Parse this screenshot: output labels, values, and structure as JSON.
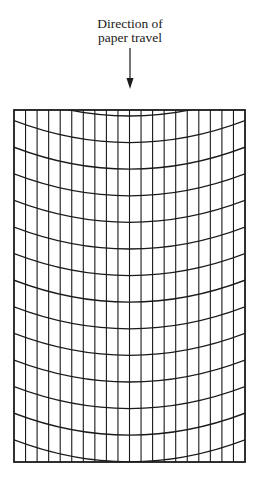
{
  "caption": {
    "line1": "Direction of",
    "line2": "paper travel"
  },
  "arrow": {
    "icon": "down-arrow-icon",
    "x": 130,
    "y_start": 48,
    "y_end": 89
  },
  "grid": {
    "frame": {
      "left": 14,
      "top": 110,
      "right": 245,
      "bottom": 462
    },
    "columns": 20,
    "curve_edge_start": 94,
    "curve_spacing": 26.6,
    "curve_count": 14,
    "sag": 22,
    "line_color": "#1a1a1a",
    "frame_stroke": 1.8,
    "line_stroke": 1.1
  }
}
